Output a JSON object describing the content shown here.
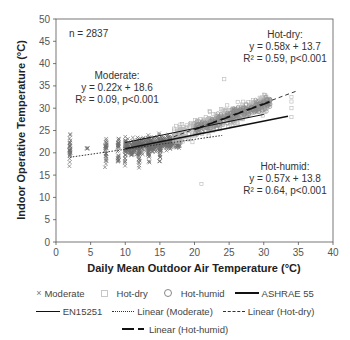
{
  "chart_data": {
    "type": "scatter",
    "title": "",
    "xlabel": "Daily Mean Outdoor Air Temperature (°C)",
    "ylabel": "Indoor Operative Temperature (°C)",
    "xlim": [
      0,
      40
    ],
    "ylim": [
      0,
      50
    ],
    "xticks": [
      0,
      5,
      10,
      15,
      20,
      25,
      30,
      35,
      40
    ],
    "yticks": [
      0,
      5,
      10,
      15,
      20,
      25,
      30,
      35,
      40,
      45,
      50
    ],
    "grid": false,
    "legend_position": "bottom",
    "annotations": {
      "n": "n = 2837",
      "moderate": [
        "Moderate:",
        "y = 0.22x + 18.6",
        "R² = 0.09, p<0.001"
      ],
      "hot_dry": [
        "Hot-dry:",
        "y = 0.58x + 13.7",
        "R² = 0.59, p<0.001"
      ],
      "hot_humid": [
        "Hot-humid:",
        "y = 0.57x + 13.8",
        "R² = 0.64, p<0.001"
      ]
    },
    "series": [
      {
        "name": "Moderate",
        "marker": "x",
        "color": "#6e6e6e",
        "x_range": [
          2,
          18
        ],
        "y_range": [
          12,
          27
        ]
      },
      {
        "name": "Hot-dry",
        "marker": "square-open",
        "color": "#b5b5b5",
        "x_range": [
          17,
          35
        ],
        "y_range": [
          15,
          36
        ]
      },
      {
        "name": "Hot-humid",
        "marker": "circle-open",
        "color": "#888888",
        "x_range": [
          20,
          31
        ],
        "y_range": [
          22,
          33
        ]
      }
    ],
    "lines": [
      {
        "name": "ASHRAE 55",
        "style": "solid-thick",
        "x": [
          10,
          33.5
        ],
        "y": [
          20.9,
          28.2
        ]
      },
      {
        "name": "EN15251",
        "style": "solid",
        "x": [
          10,
          30
        ],
        "y": [
          22.3,
          28.6
        ]
      },
      {
        "name": "Linear (Moderate)",
        "style": "dotted",
        "x": [
          2,
          24
        ],
        "y": [
          19.0,
          23.9
        ]
      },
      {
        "name": "Linear (Hot-dry)",
        "style": "dashed",
        "x": [
          17,
          35
        ],
        "y": [
          23.6,
          34.0
        ]
      },
      {
        "name": "Linear (Hot-humid)",
        "style": "long-dash-thick",
        "x": [
          20,
          31
        ],
        "y": [
          25.2,
          31.5
        ]
      }
    ]
  },
  "legend": {
    "row1": [
      "Moderate",
      "Hot-dry",
      "Hot-humid",
      "ASHRAE 55"
    ],
    "row2": [
      "EN15251",
      "Linear (Moderate)",
      "Linear (Hot-dry)"
    ],
    "row3": [
      "Linear (Hot-humid)"
    ]
  }
}
